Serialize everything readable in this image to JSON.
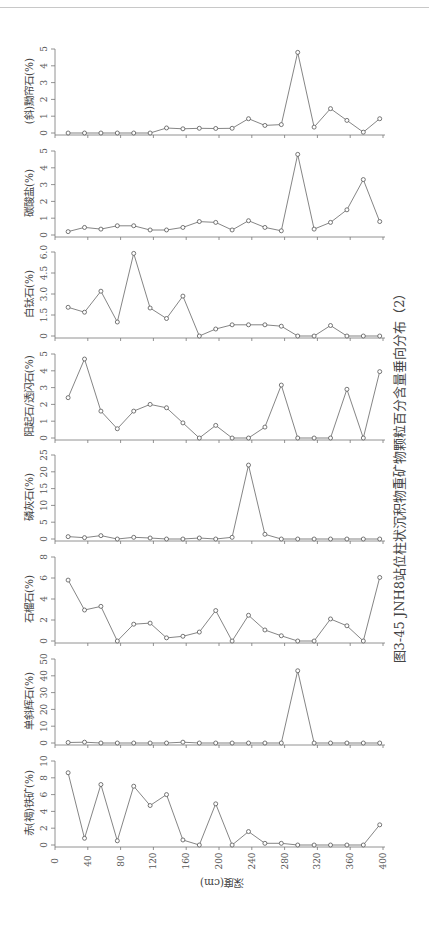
{
  "figure": {
    "caption": "图3-45  JNH8站位柱状沉积物重矿物颗粒百分含量垂向分布（2）",
    "xlabel": "深度(cm)"
  },
  "chart_data": {
    "type": "line",
    "title": "图3-45 JNH8站位柱状沉积物重矿物颗粒百分含量垂向分布（2）",
    "xlabel": "深度(cm)",
    "xlim": [
      0,
      400
    ],
    "x_ticks": [
      0,
      40,
      80,
      120,
      160,
      200,
      240,
      280,
      320,
      360,
      400
    ],
    "x": [
      16,
      36,
      56,
      76,
      96,
      116,
      136,
      156,
      176,
      196,
      216,
      236,
      256,
      276,
      296,
      316,
      336,
      356,
      376,
      396
    ],
    "grid": false,
    "orientation": "rotated 90° counter-clockwise (depth runs left-to-right along page bottom)",
    "panels": [
      {
        "name": "(斜)黝帘石(%)",
        "ylim": [
          0,
          5
        ],
        "y_ticks": [
          "0",
          "1",
          "2",
          "3",
          "4",
          "5"
        ],
        "values": [
          0,
          0,
          0,
          0,
          0,
          0,
          0.3,
          0.25,
          0.28,
          0.27,
          0.28,
          0.85,
          0.45,
          0.5,
          4.8,
          0.35,
          1.45,
          0.75,
          0.05,
          0.85
        ]
      },
      {
        "name": "碳酸盐(%)",
        "ylim": [
          0,
          5
        ],
        "y_ticks": [
          "0",
          "1",
          "2",
          "3",
          "4",
          "5"
        ],
        "values": [
          0.2,
          0.45,
          0.35,
          0.55,
          0.55,
          0.3,
          0.3,
          0.45,
          0.8,
          0.75,
          0.3,
          0.85,
          0.45,
          0.25,
          4.8,
          0.35,
          0.75,
          1.5,
          3.3,
          0.8
        ]
      },
      {
        "name": "白钛石(%)",
        "ylim": [
          0,
          6
        ],
        "y_ticks": [
          "0",
          "1.5",
          "3.0",
          "4.5",
          "6.0"
        ],
        "values": [
          2.05,
          1.7,
          3.2,
          1.0,
          5.9,
          2.0,
          1.25,
          2.85,
          0,
          0.5,
          0.8,
          0.8,
          0.8,
          0.7,
          0,
          0,
          0.75,
          0,
          0,
          0
        ]
      },
      {
        "name": "阳起石/透闪石(%)",
        "ylim": [
          0,
          5
        ],
        "y_ticks": [
          "0",
          "1",
          "2",
          "3",
          "4",
          "5"
        ],
        "values": [
          2.4,
          4.7,
          1.6,
          0.55,
          1.6,
          2.0,
          1.8,
          0.9,
          0,
          0.75,
          0,
          0,
          0.65,
          3.15,
          0,
          0,
          0,
          2.9,
          0,
          3.95
        ]
      },
      {
        "name": "磷灰石(%)",
        "ylim": [
          0,
          25
        ],
        "y_ticks": [
          "0",
          "5",
          "10",
          "15",
          "20",
          "25"
        ],
        "values": [
          0.7,
          0.4,
          1.0,
          0,
          0.5,
          0.3,
          0,
          0,
          0.3,
          0,
          0.5,
          22,
          1.4,
          0,
          0,
          0,
          0,
          0,
          0,
          0
        ]
      },
      {
        "name": "石榴石(%)",
        "ylim": [
          0,
          8
        ],
        "y_ticks": [
          "0",
          "2",
          "4",
          "6",
          "8"
        ],
        "values": [
          5.8,
          2.95,
          3.3,
          0,
          1.6,
          1.7,
          0.3,
          0.45,
          0.85,
          2.9,
          0,
          2.45,
          1.05,
          0.5,
          0,
          0,
          2.1,
          1.45,
          0,
          6.05
        ]
      },
      {
        "name": "单斜辉石(%)",
        "ylim": [
          0,
          50
        ],
        "y_ticks": [
          "0",
          "10",
          "20",
          "30",
          "40",
          "50"
        ],
        "values": [
          0.3,
          0.5,
          0,
          0,
          0,
          0,
          0,
          0.5,
          0,
          0,
          0,
          0,
          0,
          0,
          43,
          0,
          0,
          0,
          0,
          0
        ]
      },
      {
        "name": "赤(褐)铁矿(%)",
        "ylim": [
          0,
          10
        ],
        "y_ticks": [
          "0",
          "2",
          "4",
          "6",
          "8",
          "10"
        ],
        "values": [
          8.6,
          0.8,
          7.2,
          0.5,
          7.0,
          4.7,
          6.0,
          0.6,
          0,
          4.9,
          0,
          1.6,
          0.2,
          0.2,
          0,
          0,
          0,
          0,
          0,
          2.4
        ]
      }
    ]
  }
}
